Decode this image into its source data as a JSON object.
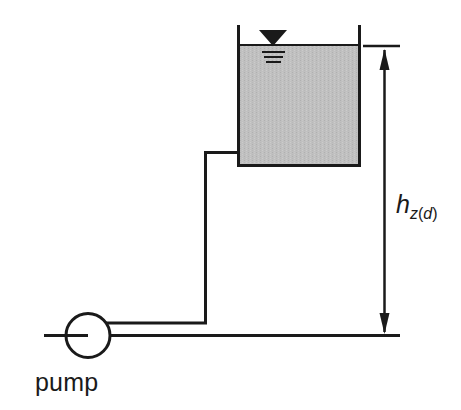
{
  "figure": {
    "background_color": "#ffffff",
    "line_color": "#1a1a1a",
    "tank_fill_color": "#c0c0c0",
    "tank_border_color": "#1a1a1a"
  },
  "labels": {
    "pump": "pump",
    "head_symbol": "h",
    "head_subscript_variable": "z",
    "head_subscript_open_paren": "(",
    "head_subscript_qualifier": "d",
    "head_subscript_close_paren": ")",
    "head_full": "h_z(d)"
  },
  "components": {
    "tank": {
      "name": "tank",
      "liquid_surface_label": "water-level",
      "liquid_fill": "#c0c0c0"
    },
    "pump": {
      "name": "pump",
      "symbol": "circle"
    },
    "water_level_symbol": {
      "name": "water-level-triangle",
      "hatch_line_count": 3
    },
    "dimension": {
      "name": "static-head-dimension",
      "arrow_top": "up-arrow",
      "arrow_bottom": "down-arrow",
      "measures": "h_z(d)"
    },
    "piping": {
      "suction_line": "pump-suction-pipe",
      "discharge_line": "pump-discharge-pipe",
      "riser": "vertical-riser-pipe",
      "datum_line": "datum-reference-line"
    }
  }
}
